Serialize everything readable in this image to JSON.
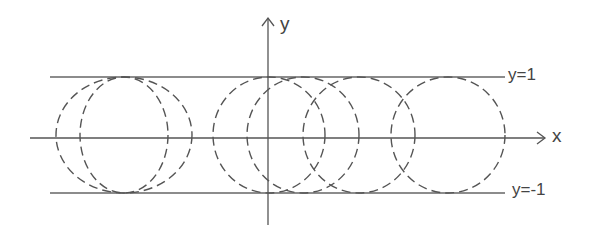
{
  "diagram": {
    "type": "geometric sketch",
    "labels": {
      "x_axis": "x",
      "y_axis": "y",
      "upper_line": "y=1",
      "lower_line": "y=-1"
    },
    "colors": {
      "stroke": "#555555",
      "background": "#ffffff"
    },
    "geometry": {
      "x_axis": {
        "y": 138,
        "x1": 30,
        "x2": 545
      },
      "y_axis": {
        "x": 268,
        "y1": 225,
        "y2": 18
      },
      "upper_line": {
        "y": 77,
        "x1": 50,
        "x2": 505
      },
      "lower_line": {
        "y": 193,
        "x1": 50,
        "x2": 505
      },
      "circles": [
        {
          "cx": 124,
          "cy": 135,
          "rx": 68,
          "ry": 58
        },
        {
          "cx": 124,
          "cy": 135,
          "rx": 44,
          "ry": 58
        },
        {
          "cx": 269,
          "cy": 135,
          "rx": 56,
          "ry": 58
        },
        {
          "cx": 303,
          "cy": 135,
          "rx": 56,
          "ry": 58
        },
        {
          "cx": 359,
          "cy": 135,
          "rx": 56,
          "ry": 58
        },
        {
          "cx": 448,
          "cy": 135,
          "rx": 57,
          "ry": 58
        }
      ]
    }
  }
}
